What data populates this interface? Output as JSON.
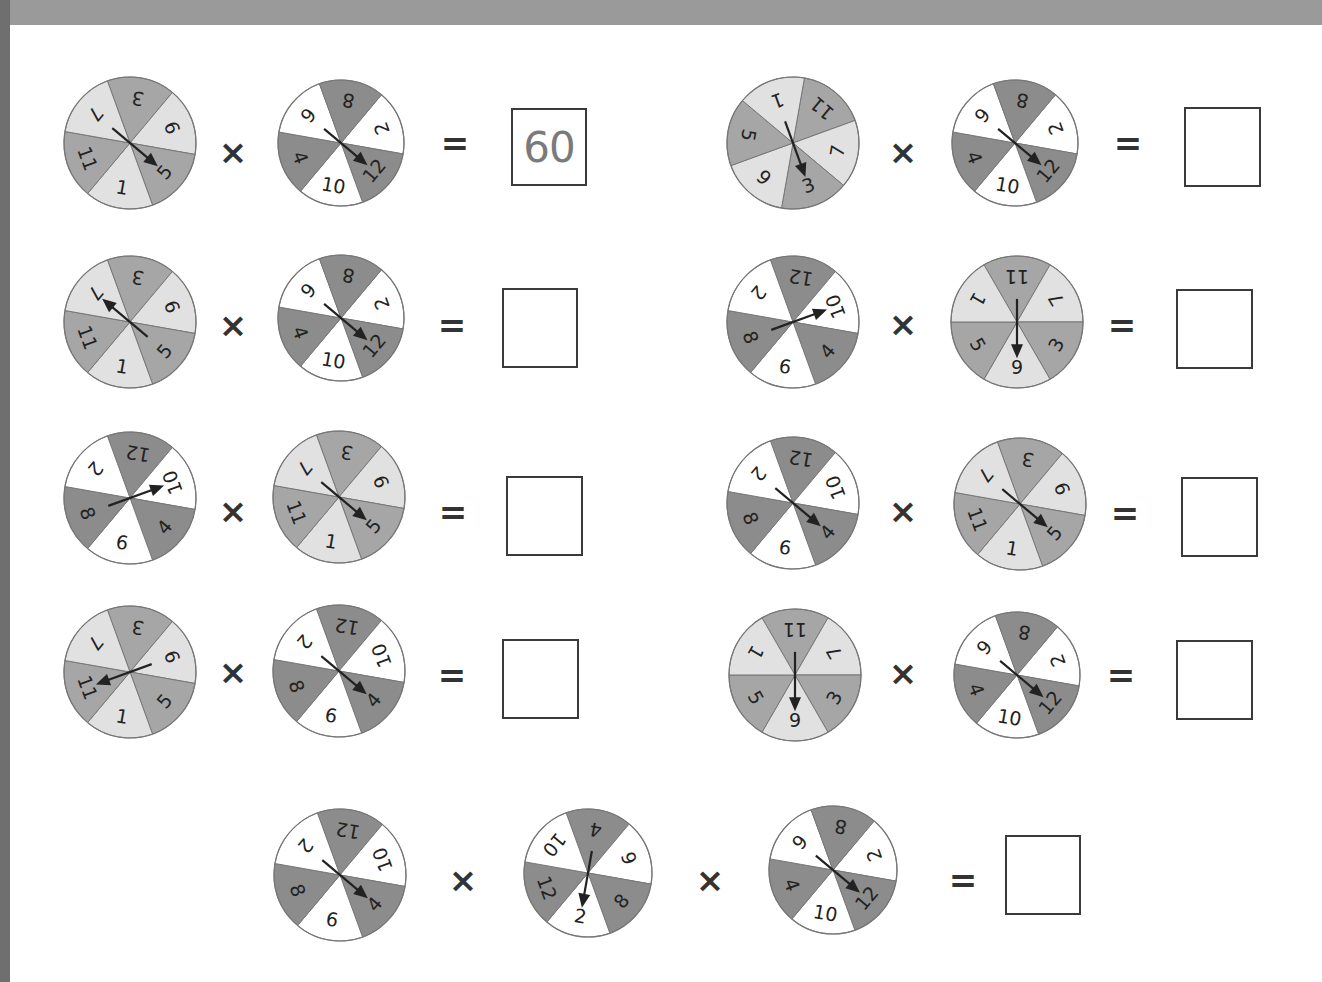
{
  "colors": {
    "odd_dark": "#a6a6a6",
    "odd_light": "#e1e1e1",
    "even_dark": "#8c8c8c",
    "even_light": "#ffffff",
    "outline": "#777777",
    "text": "#222222",
    "arrow": "#222222"
  },
  "operators": {
    "times": "×",
    "equals": "="
  },
  "spinner_types": {
    "odd": {
      "labels": [
        "3",
        "9",
        "5",
        "1",
        "11",
        "7"
      ],
      "palette": [
        "odd_dark",
        "odd_light"
      ]
    },
    "odd_rot": {
      "labels": [
        "11",
        "7",
        "3",
        "9",
        "5",
        "1"
      ],
      "palette": [
        "odd_dark",
        "odd_light"
      ]
    },
    "even": {
      "labels": [
        "2",
        "12",
        "10",
        "4",
        "6",
        "8"
      ],
      "palette": [
        "even_light",
        "even_dark"
      ]
    },
    "even_rot": {
      "labels": [
        "12",
        "10",
        "4",
        "6",
        "8",
        "2"
      ],
      "palette": [
        "even_dark",
        "even_light"
      ]
    },
    "even_alt": {
      "labels": [
        "4",
        "6",
        "8",
        "2",
        "12",
        "10"
      ],
      "palette": [
        "even_dark",
        "even_light"
      ]
    }
  },
  "problems": [
    {
      "id": "row1-left",
      "spinners": [
        {
          "type": "odd",
          "cx": 130,
          "cy": 143,
          "r": 66,
          "start_angle": -110,
          "arrow_value": "5"
        },
        {
          "type": "even",
          "cx": 341,
          "cy": 143,
          "r": 63,
          "start_angle": -50,
          "arrow_value": "12"
        }
      ],
      "operators": [
        {
          "kind": "times",
          "x": 233,
          "y": 152
        }
      ],
      "equals": {
        "x": 455,
        "y": 143
      },
      "answer": {
        "x": 511,
        "y": 108,
        "w": 76,
        "h": 78,
        "value": "60"
      }
    },
    {
      "id": "row1-right",
      "spinners": [
        {
          "type": "odd_rot",
          "cx": 793,
          "cy": 143,
          "r": 66,
          "start_angle": -80,
          "arrow_value": "3"
        },
        {
          "type": "even",
          "cx": 1015,
          "cy": 143,
          "r": 63,
          "start_angle": -50,
          "arrow_value": "12"
        }
      ],
      "operators": [
        {
          "kind": "times",
          "x": 903,
          "y": 152
        }
      ],
      "equals": {
        "x": 1128,
        "y": 143
      },
      "answer": {
        "x": 1184,
        "y": 107,
        "w": 77,
        "h": 80,
        "value": ""
      }
    },
    {
      "id": "row2-left",
      "spinners": [
        {
          "type": "odd",
          "cx": 130,
          "cy": 322,
          "r": 66,
          "start_angle": -110,
          "arrow_value": "7"
        },
        {
          "type": "even",
          "cx": 341,
          "cy": 318,
          "r": 63,
          "start_angle": -50,
          "arrow_value": "12"
        }
      ],
      "operators": [
        {
          "kind": "times",
          "x": 233,
          "y": 325
        }
      ],
      "equals": {
        "x": 452,
        "y": 325
      },
      "answer": {
        "x": 502,
        "y": 288,
        "w": 76,
        "h": 80,
        "value": ""
      }
    },
    {
      "id": "row2-right",
      "spinners": [
        {
          "type": "even_rot",
          "cx": 793,
          "cy": 322,
          "r": 66,
          "start_angle": -110,
          "arrow_value": "10"
        },
        {
          "type": "odd_rot",
          "cx": 1017,
          "cy": 322,
          "r": 66,
          "start_angle": -120,
          "arrow_value": "9",
          "sector_labels_override": [
            "11",
            "7",
            "3",
            "9",
            "5",
            "1"
          ]
        }
      ],
      "operators": [
        {
          "kind": "times",
          "x": 903,
          "y": 324
        }
      ],
      "equals": {
        "x": 1122,
        "y": 325
      },
      "answer": {
        "x": 1176,
        "y": 289,
        "w": 77,
        "h": 80,
        "value": ""
      }
    },
    {
      "id": "row3-left",
      "spinners": [
        {
          "type": "even_rot",
          "cx": 130,
          "cy": 498,
          "r": 66,
          "start_angle": -110,
          "arrow_value": "10"
        },
        {
          "type": "odd",
          "cx": 339,
          "cy": 497,
          "r": 66,
          "start_angle": -110,
          "arrow_value": "5"
        }
      ],
      "operators": [
        {
          "kind": "times",
          "x": 233,
          "y": 511
        }
      ],
      "equals": {
        "x": 453,
        "y": 512
      },
      "answer": {
        "x": 506,
        "y": 476,
        "w": 77,
        "h": 80,
        "value": ""
      }
    },
    {
      "id": "row3-right",
      "spinners": [
        {
          "type": "even_rot",
          "cx": 793,
          "cy": 503,
          "r": 66,
          "start_angle": -110,
          "arrow_value": "4"
        },
        {
          "type": "odd",
          "cx": 1020,
          "cy": 504,
          "r": 66,
          "start_angle": -110,
          "arrow_value": "5"
        }
      ],
      "operators": [
        {
          "kind": "times",
          "x": 903,
          "y": 511
        }
      ],
      "equals": {
        "x": 1125,
        "y": 513
      },
      "answer": {
        "x": 1181,
        "y": 477,
        "w": 77,
        "h": 80,
        "value": ""
      }
    },
    {
      "id": "row4-left",
      "spinners": [
        {
          "type": "odd",
          "cx": 130,
          "cy": 672,
          "r": 66,
          "start_angle": -110,
          "arrow_value": "11"
        },
        {
          "type": "even_rot",
          "cx": 339,
          "cy": 671,
          "r": 66,
          "start_angle": -110,
          "arrow_value": "4"
        }
      ],
      "operators": [
        {
          "kind": "times",
          "x": 233,
          "y": 672
        }
      ],
      "equals": {
        "x": 452,
        "y": 675
      },
      "answer": {
        "x": 502,
        "y": 639,
        "w": 77,
        "h": 80,
        "value": ""
      }
    },
    {
      "id": "row4-right",
      "spinners": [
        {
          "type": "odd_rot",
          "cx": 795,
          "cy": 675,
          "r": 66,
          "start_angle": -120,
          "arrow_value": "9",
          "sector_labels_override": [
            "11",
            "7",
            "3",
            "9",
            "5",
            "1"
          ]
        },
        {
          "type": "even",
          "cx": 1017,
          "cy": 675,
          "r": 63,
          "start_angle": -50,
          "arrow_value": "12"
        }
      ],
      "operators": [
        {
          "kind": "times",
          "x": 903,
          "y": 673
        }
      ],
      "equals": {
        "x": 1121,
        "y": 675
      },
      "answer": {
        "x": 1176,
        "y": 640,
        "w": 77,
        "h": 80,
        "value": ""
      }
    },
    {
      "id": "row5-center",
      "spinners": [
        {
          "type": "even_rot",
          "cx": 340,
          "cy": 875,
          "r": 66,
          "start_angle": -110,
          "arrow_value": "4"
        },
        {
          "type": "even_alt",
          "cx": 588,
          "cy": 873,
          "r": 64,
          "start_angle": -110,
          "arrow_value": "2"
        },
        {
          "type": "even",
          "cx": 833,
          "cy": 870,
          "r": 64,
          "start_angle": -50,
          "arrow_value": "12"
        }
      ],
      "operators": [
        {
          "kind": "times",
          "x": 463,
          "y": 880
        },
        {
          "kind": "times",
          "x": 710,
          "y": 880
        }
      ],
      "equals": {
        "x": 963,
        "y": 880
      },
      "answer": {
        "x": 1005,
        "y": 835,
        "w": 76,
        "h": 80,
        "value": ""
      }
    }
  ]
}
